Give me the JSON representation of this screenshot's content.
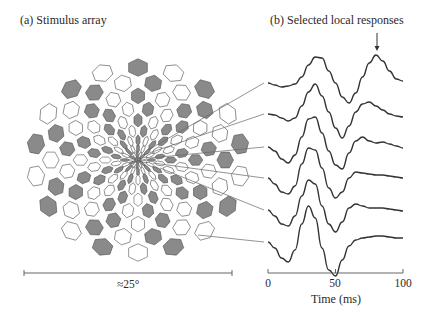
{
  "panel_a": {
    "title": "(a)  Stimulus array",
    "scale_label": "≈25°",
    "colors": {
      "hex_fill_dark": "#8a8a8a",
      "hex_fill_light": "#ffffff",
      "hex_stroke": "#555555"
    },
    "array": {
      "center_x": 138,
      "center_y": 160,
      "rings": 10,
      "sectors": 18,
      "outer_radius_x": 112,
      "outer_radius_y": 100
    },
    "scale_bar": {
      "x1": 24,
      "x2": 232,
      "y": 273
    }
  },
  "panel_b": {
    "title": "(b)  Selected local responses",
    "axis": {
      "xlabel": "Time (ms)",
      "ticks": [
        "0",
        "50",
        "100"
      ],
      "x0": 268,
      "x1": 403,
      "y": 273
    },
    "arrow": {
      "x": 377,
      "y_top": 33,
      "y_tip": 51
    }
  },
  "chart_data": {
    "type": "line",
    "title": "Selected local responses",
    "xlabel": "Time (ms)",
    "ylabel": "",
    "xlim": [
      0,
      100
    ],
    "x_ticks": [
      0,
      50,
      100
    ],
    "x": [
      0,
      5,
      10,
      15,
      20,
      25,
      30,
      35,
      40,
      45,
      50,
      55,
      60,
      65,
      70,
      75,
      80,
      85,
      90,
      95,
      100
    ],
    "series": [
      {
        "name": "trace 1 (most central)",
        "baseline_y": 83,
        "values": [
          0,
          -2,
          -4,
          -3,
          -1,
          6,
          18,
          26,
          25,
          12,
          0,
          -14,
          -20,
          -10,
          6,
          20,
          28,
          22,
          12,
          4,
          2
        ]
      },
      {
        "name": "trace 2",
        "baseline_y": 114,
        "values": [
          0,
          -1,
          -4,
          -7,
          -4,
          8,
          22,
          30,
          18,
          2,
          -14,
          -24,
          -12,
          2,
          10,
          12,
          8,
          4,
          0,
          -2,
          -3
        ]
      },
      {
        "name": "trace 3",
        "baseline_y": 147,
        "values": [
          0,
          -4,
          -12,
          -16,
          -8,
          10,
          28,
          30,
          14,
          -4,
          -18,
          -22,
          -6,
          6,
          10,
          6,
          4,
          5,
          3,
          1,
          -1
        ]
      },
      {
        "name": "trace 4",
        "baseline_y": 178,
        "values": [
          0,
          -6,
          -14,
          -16,
          -8,
          14,
          30,
          28,
          10,
          -10,
          -20,
          -14,
          0,
          6,
          5,
          4,
          3,
          3,
          2,
          1,
          0
        ]
      },
      {
        "name": "trace 5",
        "baseline_y": 210,
        "values": [
          0,
          -6,
          -14,
          -16,
          -6,
          14,
          30,
          26,
          4,
          -14,
          -22,
          -12,
          2,
          6,
          4,
          2,
          2,
          2,
          1,
          0,
          -1
        ]
      },
      {
        "name": "trace 6 (most peripheral)",
        "baseline_y": 242,
        "values": [
          0,
          -6,
          -16,
          -20,
          -8,
          18,
          36,
          24,
          -6,
          -28,
          -34,
          -18,
          -4,
          2,
          4,
          5,
          6,
          6,
          5,
          4,
          4
        ]
      }
    ],
    "annotations": [
      {
        "type": "arrow",
        "x": 82,
        "series": "trace 1 (most central)",
        "text": ""
      }
    ]
  }
}
